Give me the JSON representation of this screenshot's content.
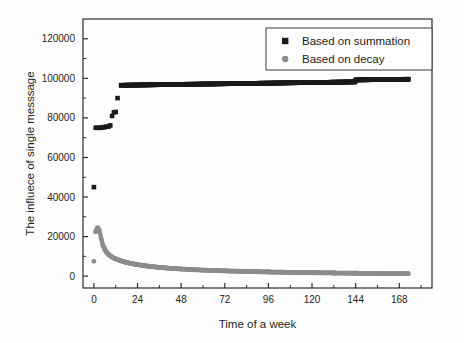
{
  "chart_data": {
    "type": "scatter",
    "title": "",
    "xlabel": "Time of a week",
    "ylabel": "The influece of single messsage",
    "xlim": [
      -6,
      186
    ],
    "ylim": [
      -6000,
      130000
    ],
    "xticks": [
      0,
      24,
      48,
      72,
      96,
      120,
      144,
      168
    ],
    "yticks": [
      0,
      20000,
      40000,
      60000,
      80000,
      100000,
      120000
    ],
    "xtick_labels": [
      "0",
      "24",
      "48",
      "72",
      "96",
      "120",
      "144",
      "168"
    ],
    "ytick_labels": [
      "0",
      "20000",
      "40000",
      "60000",
      "80000",
      "100000",
      "120000"
    ],
    "minor_ticks": true,
    "grid": false,
    "legend_position": "top-right",
    "frame": "box",
    "colors": {
      "summation": "#1a1a1a",
      "decay": "#8c8c8c",
      "axis": "#2b2b2b",
      "background": "#fefefe"
    },
    "series": [
      {
        "name": "Based on summation",
        "marker": "square",
        "color": "#1a1a1a",
        "points": [
          [
            0,
            45000
          ],
          [
            1,
            75000
          ],
          [
            2,
            75000
          ],
          [
            3,
            75000
          ],
          [
            4,
            75000
          ],
          [
            5,
            75300
          ],
          [
            6,
            75300
          ],
          [
            7,
            75600
          ],
          [
            8,
            75600
          ],
          [
            9,
            76200
          ],
          [
            10,
            81000
          ],
          [
            11,
            82800
          ],
          [
            12,
            83000
          ],
          [
            13,
            90000
          ],
          [
            15,
            96500
          ],
          [
            17,
            96500
          ],
          [
            19,
            96600
          ],
          [
            21,
            96600
          ],
          [
            23,
            96600
          ],
          [
            25,
            96700
          ],
          [
            27,
            96700
          ],
          [
            29,
            96700
          ],
          [
            31,
            96800
          ],
          [
            33,
            96800
          ],
          [
            35,
            96800
          ],
          [
            37,
            96900
          ],
          [
            39,
            96900
          ],
          [
            41,
            96900
          ],
          [
            43,
            97000
          ],
          [
            45,
            97000
          ],
          [
            47,
            97000
          ],
          [
            49,
            97000
          ],
          [
            51,
            97100
          ],
          [
            53,
            97100
          ],
          [
            55,
            97100
          ],
          [
            57,
            97100
          ],
          [
            59,
            97200
          ],
          [
            61,
            97200
          ],
          [
            63,
            97200
          ],
          [
            65,
            97200
          ],
          [
            67,
            97300
          ],
          [
            69,
            97300
          ],
          [
            71,
            97300
          ],
          [
            73,
            97300
          ],
          [
            75,
            97400
          ],
          [
            77,
            97400
          ],
          [
            79,
            97400
          ],
          [
            81,
            97400
          ],
          [
            83,
            97500
          ],
          [
            85,
            97500
          ],
          [
            87,
            97500
          ],
          [
            89,
            97500
          ],
          [
            91,
            97600
          ],
          [
            93,
            97600
          ],
          [
            95,
            97600
          ],
          [
            97,
            97600
          ],
          [
            99,
            97700
          ],
          [
            101,
            97700
          ],
          [
            103,
            97700
          ],
          [
            105,
            97700
          ],
          [
            107,
            97800
          ],
          [
            109,
            97800
          ],
          [
            111,
            97800
          ],
          [
            113,
            97800
          ],
          [
            115,
            97900
          ],
          [
            117,
            97900
          ],
          [
            119,
            97900
          ],
          [
            121,
            97900
          ],
          [
            123,
            98000
          ],
          [
            125,
            98000
          ],
          [
            127,
            98000
          ],
          [
            129,
            98000
          ],
          [
            131,
            98100
          ],
          [
            133,
            98100
          ],
          [
            135,
            98100
          ],
          [
            137,
            98100
          ],
          [
            139,
            98200
          ],
          [
            141,
            98200
          ],
          [
            143,
            98200
          ],
          [
            144,
            99200
          ],
          [
            146,
            99200
          ],
          [
            148,
            99250
          ],
          [
            150,
            99250
          ],
          [
            152,
            99300
          ],
          [
            154,
            99300
          ],
          [
            156,
            99350
          ],
          [
            158,
            99350
          ],
          [
            160,
            99400
          ],
          [
            162,
            99400
          ],
          [
            164,
            99450
          ],
          [
            166,
            99450
          ],
          [
            168,
            99500
          ],
          [
            170,
            99500
          ],
          [
            172,
            99550
          ],
          [
            173,
            99550
          ]
        ]
      },
      {
        "name": "Based on decay",
        "marker": "circle",
        "color": "#8c8c8c",
        "points": [
          [
            0,
            7500
          ],
          [
            1,
            22500
          ],
          [
            2,
            24500
          ],
          [
            3,
            23000
          ],
          [
            4,
            19000
          ],
          [
            5,
            15500
          ],
          [
            6,
            13500
          ],
          [
            7,
            12000
          ],
          [
            8,
            11000
          ],
          [
            9,
            10200
          ],
          [
            10,
            9600
          ],
          [
            11,
            9100
          ],
          [
            12,
            8700
          ],
          [
            13,
            8300
          ],
          [
            14,
            8000
          ],
          [
            15,
            7700
          ],
          [
            16,
            7400
          ],
          [
            17,
            7150
          ],
          [
            18,
            6900
          ],
          [
            19,
            6700
          ],
          [
            20,
            6500
          ],
          [
            21,
            6300
          ],
          [
            22,
            6100
          ],
          [
            23,
            5950
          ],
          [
            24,
            5800
          ],
          [
            26,
            5500
          ],
          [
            28,
            5250
          ],
          [
            30,
            5000
          ],
          [
            32,
            4800
          ],
          [
            34,
            4600
          ],
          [
            36,
            4400
          ],
          [
            38,
            4250
          ],
          [
            40,
            4100
          ],
          [
            42,
            3950
          ],
          [
            44,
            3800
          ],
          [
            46,
            3700
          ],
          [
            48,
            3600
          ],
          [
            52,
            3400
          ],
          [
            56,
            3200
          ],
          [
            60,
            3050
          ],
          [
            64,
            2900
          ],
          [
            68,
            2780
          ],
          [
            72,
            2650
          ],
          [
            76,
            2550
          ],
          [
            80,
            2450
          ],
          [
            84,
            2350
          ],
          [
            88,
            2270
          ],
          [
            92,
            2180
          ],
          [
            96,
            2100
          ],
          [
            100,
            2030
          ],
          [
            104,
            1960
          ],
          [
            108,
            1900
          ],
          [
            112,
            1840
          ],
          [
            116,
            1780
          ],
          [
            120,
            1730
          ],
          [
            124,
            1680
          ],
          [
            128,
            1630
          ],
          [
            132,
            1580
          ],
          [
            136,
            1540
          ],
          [
            140,
            1500
          ],
          [
            144,
            1460
          ],
          [
            148,
            1420
          ],
          [
            152,
            1390
          ],
          [
            156,
            1350
          ],
          [
            160,
            1320
          ],
          [
            164,
            1290
          ],
          [
            168,
            1260
          ],
          [
            172,
            1230
          ],
          [
            173,
            1220
          ]
        ]
      }
    ],
    "legend_entries": [
      {
        "label": "Based on summation",
        "marker": "square",
        "color": "#1a1a1a"
      },
      {
        "label": "Based on decay",
        "marker": "circle",
        "color": "#8c8c8c"
      }
    ]
  }
}
